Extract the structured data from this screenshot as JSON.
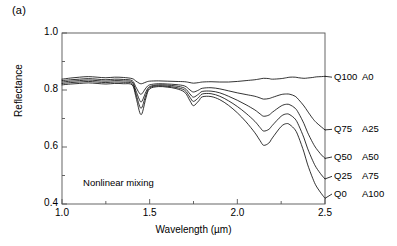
{
  "panel": {
    "label": "(a)"
  },
  "annotation": {
    "text": "Nonlinear mixing",
    "x": 1.12,
    "y": 0.475
  },
  "chart_data": {
    "type": "line",
    "title": "",
    "xlabel": "Wavelength (µm)",
    "ylabel": "Reflectance",
    "xlim": [
      1.0,
      2.5
    ],
    "ylim": [
      0.4,
      1.0
    ],
    "xticks": [
      1.0,
      1.5,
      2.0,
      2.5
    ],
    "xticklabels": [
      "1.0",
      "1.5",
      "2.0",
      "2.5"
    ],
    "yticks": [
      0.4,
      0.6,
      0.8,
      1.0
    ],
    "yticklabels": [
      "0.4",
      "0.6",
      "0.8",
      "1.0"
    ],
    "xminorticks": [
      1.25,
      1.75,
      2.25
    ],
    "yminorticks": [
      0.5,
      0.7,
      0.9
    ],
    "grid": false,
    "legend_position": "right-outside",
    "line_color": "#000000",
    "line_width": 0.8,
    "series": [
      {
        "name": "Q100 A0",
        "label_q": "Q100",
        "label_a": "A0",
        "label_y": 0.845,
        "x": [
          1.0,
          1.05,
          1.1,
          1.15,
          1.2,
          1.25,
          1.3,
          1.35,
          1.4,
          1.42,
          1.44,
          1.45,
          1.46,
          1.48,
          1.5,
          1.55,
          1.6,
          1.65,
          1.7,
          1.73,
          1.75,
          1.78,
          1.8,
          1.85,
          1.9,
          1.95,
          2.0,
          2.05,
          2.1,
          2.13,
          2.15,
          2.18,
          2.2,
          2.25,
          2.28,
          2.3,
          2.33,
          2.35,
          2.38,
          2.4,
          2.43,
          2.45,
          2.48,
          2.5
        ],
        "y": [
          0.838,
          0.842,
          0.845,
          0.847,
          0.845,
          0.843,
          0.845,
          0.844,
          0.84,
          0.832,
          0.824,
          0.822,
          0.823,
          0.828,
          0.831,
          0.832,
          0.831,
          0.83,
          0.829,
          0.826,
          0.824,
          0.826,
          0.828,
          0.829,
          0.828,
          0.828,
          0.83,
          0.833,
          0.836,
          0.839,
          0.841,
          0.84,
          0.838,
          0.84,
          0.843,
          0.845,
          0.845,
          0.843,
          0.841,
          0.842,
          0.844,
          0.846,
          0.847,
          0.848
        ]
      },
      {
        "name": "Q75 A25",
        "label_q": "Q75",
        "label_a": "A25",
        "label_y": 0.662,
        "x": [
          1.0,
          1.05,
          1.1,
          1.15,
          1.2,
          1.25,
          1.3,
          1.35,
          1.4,
          1.42,
          1.44,
          1.45,
          1.46,
          1.48,
          1.5,
          1.55,
          1.6,
          1.65,
          1.7,
          1.73,
          1.75,
          1.78,
          1.8,
          1.85,
          1.9,
          1.95,
          2.0,
          2.05,
          2.1,
          2.13,
          2.15,
          2.18,
          2.2,
          2.25,
          2.28,
          2.3,
          2.33,
          2.35,
          2.38,
          2.4,
          2.43,
          2.45,
          2.48,
          2.5
        ],
        "y": [
          0.833,
          0.836,
          0.838,
          0.84,
          0.838,
          0.836,
          0.838,
          0.837,
          0.833,
          0.812,
          0.79,
          0.785,
          0.79,
          0.808,
          0.818,
          0.822,
          0.821,
          0.819,
          0.814,
          0.8,
          0.793,
          0.8,
          0.806,
          0.808,
          0.804,
          0.797,
          0.79,
          0.784,
          0.778,
          0.772,
          0.768,
          0.77,
          0.774,
          0.784,
          0.786,
          0.785,
          0.778,
          0.766,
          0.744,
          0.726,
          0.7,
          0.686,
          0.67,
          0.66
        ]
      },
      {
        "name": "Q50 A50",
        "label_q": "Q50",
        "label_a": "A50",
        "label_y": 0.565,
        "x": [
          1.0,
          1.05,
          1.1,
          1.15,
          1.2,
          1.25,
          1.3,
          1.35,
          1.4,
          1.42,
          1.44,
          1.45,
          1.46,
          1.48,
          1.5,
          1.55,
          1.6,
          1.65,
          1.7,
          1.73,
          1.75,
          1.78,
          1.8,
          1.85,
          1.9,
          1.95,
          2.0,
          2.05,
          2.1,
          2.13,
          2.15,
          2.18,
          2.2,
          2.25,
          2.28,
          2.3,
          2.33,
          2.35,
          2.38,
          2.4,
          2.43,
          2.45,
          2.48,
          2.5
        ],
        "y": [
          0.828,
          0.831,
          0.833,
          0.835,
          0.833,
          0.831,
          0.833,
          0.832,
          0.828,
          0.8,
          0.768,
          0.758,
          0.765,
          0.795,
          0.812,
          0.818,
          0.817,
          0.814,
          0.806,
          0.786,
          0.775,
          0.786,
          0.795,
          0.796,
          0.79,
          0.778,
          0.764,
          0.748,
          0.73,
          0.716,
          0.708,
          0.712,
          0.722,
          0.744,
          0.75,
          0.748,
          0.736,
          0.718,
          0.682,
          0.652,
          0.615,
          0.595,
          0.572,
          0.56
        ]
      },
      {
        "name": "Q25 A75",
        "label_q": "Q25",
        "label_a": "A75",
        "label_y": 0.497,
        "x": [
          1.0,
          1.05,
          1.1,
          1.15,
          1.2,
          1.25,
          1.3,
          1.35,
          1.4,
          1.42,
          1.44,
          1.45,
          1.46,
          1.48,
          1.5,
          1.55,
          1.6,
          1.65,
          1.7,
          1.73,
          1.75,
          1.78,
          1.8,
          1.85,
          1.9,
          1.95,
          2.0,
          2.05,
          2.1,
          2.13,
          2.15,
          2.18,
          2.2,
          2.25,
          2.28,
          2.3,
          2.33,
          2.35,
          2.38,
          2.4,
          2.43,
          2.45,
          2.48,
          2.5
        ],
        "y": [
          0.823,
          0.826,
          0.828,
          0.83,
          0.828,
          0.826,
          0.828,
          0.827,
          0.823,
          0.79,
          0.748,
          0.736,
          0.745,
          0.785,
          0.808,
          0.815,
          0.813,
          0.809,
          0.799,
          0.774,
          0.76,
          0.774,
          0.786,
          0.787,
          0.778,
          0.762,
          0.742,
          0.718,
          0.69,
          0.668,
          0.656,
          0.662,
          0.676,
          0.708,
          0.716,
          0.713,
          0.698,
          0.676,
          0.632,
          0.596,
          0.552,
          0.528,
          0.502,
          0.488
        ]
      },
      {
        "name": "Q0 A100",
        "label_q": "Q0",
        "label_a": "A100",
        "label_y": 0.435,
        "x": [
          1.0,
          1.05,
          1.1,
          1.15,
          1.2,
          1.25,
          1.3,
          1.35,
          1.4,
          1.42,
          1.44,
          1.45,
          1.46,
          1.48,
          1.5,
          1.55,
          1.6,
          1.65,
          1.7,
          1.73,
          1.75,
          1.78,
          1.8,
          1.85,
          1.9,
          1.95,
          2.0,
          2.05,
          2.1,
          2.13,
          2.15,
          2.18,
          2.2,
          2.25,
          2.28,
          2.3,
          2.33,
          2.35,
          2.38,
          2.4,
          2.43,
          2.45,
          2.48,
          2.5
        ],
        "y": [
          0.818,
          0.821,
          0.823,
          0.825,
          0.823,
          0.821,
          0.823,
          0.822,
          0.818,
          0.78,
          0.728,
          0.714,
          0.724,
          0.775,
          0.804,
          0.812,
          0.81,
          0.805,
          0.792,
          0.762,
          0.745,
          0.762,
          0.776,
          0.777,
          0.766,
          0.746,
          0.72,
          0.688,
          0.65,
          0.622,
          0.606,
          0.614,
          0.632,
          0.672,
          0.682,
          0.678,
          0.66,
          0.634,
          0.582,
          0.54,
          0.49,
          0.463,
          0.436,
          0.42
        ]
      }
    ]
  }
}
